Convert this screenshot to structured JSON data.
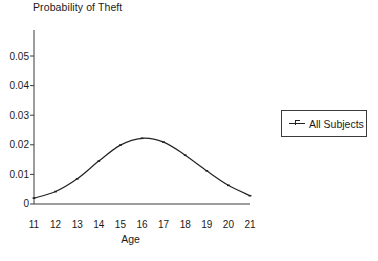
{
  "chart_data": {
    "type": "line",
    "title": "Probability of Theft",
    "xlabel": "Age",
    "ylabel": "",
    "x": [
      11,
      12,
      13,
      14,
      15,
      16,
      17,
      18,
      19,
      20,
      21
    ],
    "xtick_labels": [
      "11",
      "12",
      "13",
      "14",
      "15",
      "16",
      "17",
      "18",
      "19",
      "20",
      "21"
    ],
    "ytick_labels": [
      "0",
      "0.01",
      "0.02",
      "0.03",
      "0.04",
      "0.05"
    ],
    "ytick_values": [
      0,
      0.01,
      0.02,
      0.03,
      0.04,
      0.05
    ],
    "xlim": [
      11,
      21
    ],
    "ylim": [
      0,
      0.05
    ],
    "grid": false,
    "legend_position": "right-outside",
    "series": [
      {
        "name": "All Subjects",
        "marker": "line-with-tick",
        "color": "#222222",
        "values": [
          0.002,
          0.0042,
          0.0085,
          0.0145,
          0.0199,
          0.0222,
          0.0209,
          0.0165,
          0.0112,
          0.0063,
          0.0028
        ]
      }
    ]
  },
  "legend": {
    "entries": [
      {
        "label": "All Subjects"
      }
    ]
  }
}
